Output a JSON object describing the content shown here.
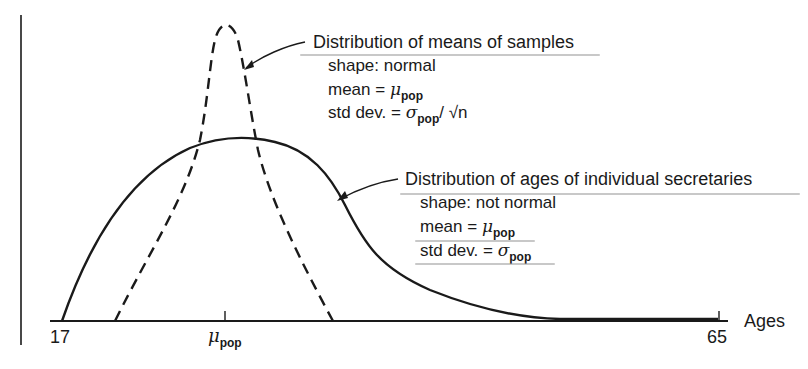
{
  "diagram": {
    "axis": {
      "label": "Ages",
      "tick_min": "17",
      "tick_max": "65",
      "tick_mean_symbol": "μ",
      "tick_mean_sub": "pop"
    },
    "sample_means": {
      "title": "Distribution of means of samples",
      "shape": "shape:  normal",
      "mean_prefix": "mean = ",
      "mean_symbol": "μ",
      "mean_sub": "pop",
      "sd_prefix": "std dev. = ",
      "sd_symbol": "σ",
      "sd_sub": "pop",
      "sd_suffix": "/ √n",
      "line_style": "dashed"
    },
    "individuals": {
      "title": "Distribution of ages of individual secretaries",
      "shape": "shape:  not normal",
      "mean_prefix": "mean = ",
      "mean_symbol": "μ",
      "mean_sub": "pop",
      "sd_prefix": "std dev. = ",
      "sd_symbol": "σ",
      "sd_sub": "pop",
      "line_style": "solid"
    },
    "colors": {
      "ink": "#1a1a1a",
      "pencil": "#9a9a9a"
    }
  }
}
